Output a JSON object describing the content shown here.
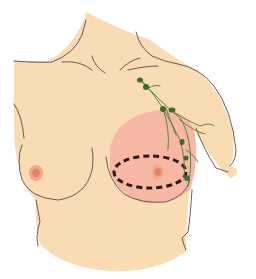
{
  "figure": {
    "subject": "Female torso, anterior view, right-side breast with highlighted surgical region",
    "colors": {
      "background": "#ffffff",
      "skin": "#f9dcb4",
      "outline": "#5a4a4a",
      "treatment_area": "#f5b3a3",
      "nipple_outer": "#f2a98a",
      "nipple_inner": "#e8836a",
      "incision": "#2a1a1a",
      "lymph": "#4f7a3a",
      "lymph_node": "#3f6a2e"
    },
    "elements": {
      "torso": "torso silhouette",
      "left_breast": "untreated breast",
      "right_breast_area": "pink highlighted treatment region",
      "incision": "dashed elliptical incision line around nipple",
      "lymphatics": "green axillary lymphatic vessels with nodes"
    }
  }
}
